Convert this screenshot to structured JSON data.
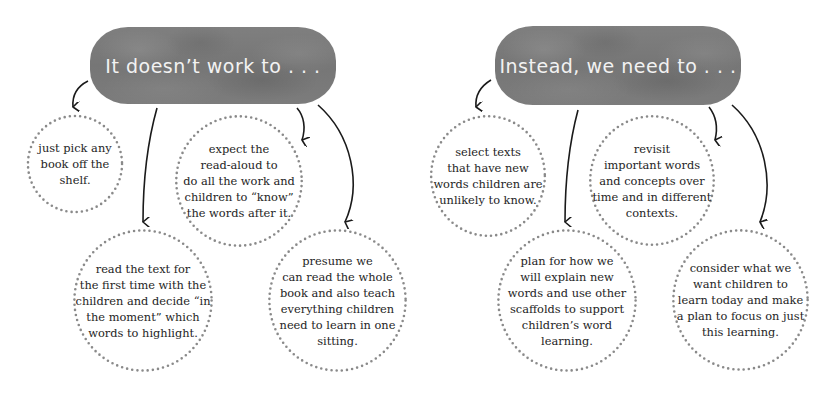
{
  "panels": [
    {
      "heading": "It doesn’t work to . . .",
      "bubbles": [
        {
          "text": "just pick any\nbook off the\nshelf."
        },
        {
          "text": "expect the\nread-aloud to\ndo all the work and\nchildren to “know”\nthe words after it."
        },
        {
          "text": "read the text for\nthe first time with the\nchildren and decide “in\nthe moment” which\nwords to highlight."
        },
        {
          "text": "presume we\ncan read the whole\nbook and also teach\neverything children\nneed to learn in one\nsitting."
        }
      ]
    },
    {
      "heading": "Instead, we need to . . .",
      "bubbles": [
        {
          "text": "select texts\nthat have new\nwords children are\nunlikely to know."
        },
        {
          "text": "revisit\nimportant words\nand concepts over\ntime and in different\ncontexts."
        },
        {
          "text": "plan for how we\nwill explain new\nwords and use other\nscaffolds to support\nchildren’s word\nlearning."
        },
        {
          "text": "consider what we\nwant children to\nlearn today and make\na plan to focus on just\nthis learning."
        }
      ]
    }
  ],
  "colors": {
    "banner": "#7a7a7a",
    "banner_text": "#f2f2f2",
    "dots": "#8a8a8a",
    "arrow": "#1a1a1a",
    "body_text": "#1e1e1e"
  }
}
